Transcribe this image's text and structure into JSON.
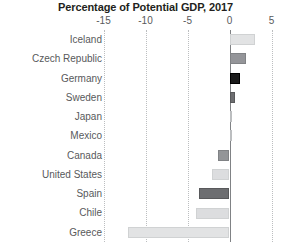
{
  "chart_data": {
    "type": "bar",
    "orientation": "horizontal",
    "title": "Percentage of Potential GDP, 2017",
    "xlabel": "",
    "ylabel": "",
    "xlim": [
      -15.5,
      5.5
    ],
    "xticks": [
      -15,
      -10,
      -5,
      0,
      5
    ],
    "xtick_labels": [
      "-15",
      "-10",
      "-5",
      "0",
      "5"
    ],
    "grid": true,
    "grid_axis": "x",
    "grid_style": "dotted",
    "zero_line": true,
    "legend": null,
    "categories": [
      "Iceland",
      "Czech Republic",
      "Germany",
      "Sweden",
      "Japan",
      "Mexico",
      "Canada",
      "United States",
      "Spain",
      "Chile",
      "Greece"
    ],
    "values": [
      3.0,
      2.0,
      1.2,
      0.7,
      0.1,
      0.05,
      -1.4,
      -2.1,
      -3.6,
      -4.0,
      -12.1
    ],
    "bar_colors": [
      "#e2e3e4",
      "#949599",
      "#1a1a1a",
      "#6d6e71",
      "#c9cbcd",
      "#c9cbcd",
      "#939598",
      "#dcdddf",
      "#6d6e71",
      "#dcdddf",
      "#e2e3e4"
    ],
    "bar_border_colors": [
      "#d0d2d3",
      "#808285",
      "#000000",
      "#58595b",
      "#bcbec0",
      "#bcbec0",
      "#808285",
      "#d0d2d3",
      "#58595b",
      "#d0d2d3",
      "#d0d2d3"
    ]
  },
  "colors": {
    "background": "#ffffff",
    "title_text": "#231f20",
    "tick_text": "#58595b",
    "category_text": "#58595b",
    "gridline": "#bcbec0",
    "zero_line": "#808285"
  }
}
